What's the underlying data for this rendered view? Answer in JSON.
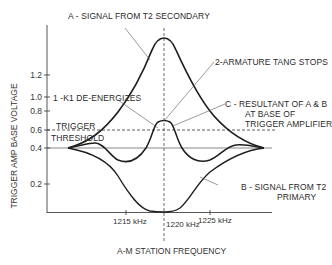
{
  "diagram": {
    "y_axis_label": "TRIGGER AMP BASE VOLTAGE",
    "x_axis_label": "A-M STATION FREQUENCY",
    "y_ticks": [
      "1.2",
      "1.0",
      "0.8",
      "0.6",
      "0.4",
      "0.2"
    ],
    "x_ticks": [
      "1215 kHz",
      "1220 kHz",
      "1225 kHz"
    ],
    "threshold_label_line1": "TRIGGER",
    "threshold_label_line2": "THRESHOLD",
    "annotations": {
      "a": "A  - SIGNAL FROM T2 SECONDARY",
      "k1": "1 -K1  DE-ENERGIZES",
      "tang": "2-ARMATURE TANG STOPS",
      "c_line1": "C - RESULTANT OF A & B",
      "c_line2": "AT BASE OF",
      "c_line3": "TRIGGER AMPLIFIER",
      "b_line1": "B - SIGNAL FROM T2",
      "b_line2": "PRIMARY"
    },
    "curves": [
      {
        "name": "A",
        "description": "Signal from T2 secondary",
        "shape": "sharp peak at 1220 kHz rising above 1.2"
      },
      {
        "name": "B",
        "description": "Signal from T2 primary",
        "shape": "trough at 1220 kHz falling to ~0"
      },
      {
        "name": "C",
        "description": "Resultant of A & B at base of trigger amplifier",
        "shape": "small central peak near 0.7 with dips near 0.3 either side"
      }
    ],
    "reference_lines": {
      "trigger_threshold": "0.6",
      "baseline": "0.4",
      "center_frequency": "1220 kHz"
    },
    "colors": {
      "line": "#222222",
      "thin": "#555555",
      "background": "#ffffff"
    }
  }
}
